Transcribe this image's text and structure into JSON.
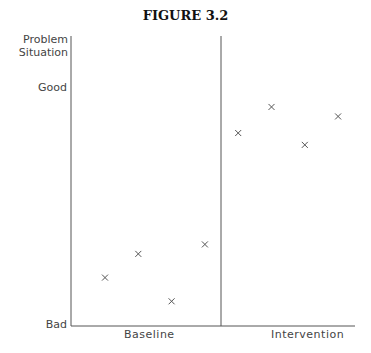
{
  "chart_data": {
    "type": "scatter",
    "title": "FIGURE 3.2",
    "ylabel": "Problem Situation",
    "xlabel": "",
    "y_ticks": [
      "Good",
      "Bad"
    ],
    "y_scale": {
      "min_label": "Bad",
      "max_label": "Good",
      "ylim": [
        0,
        10
      ],
      "note": "qualitative scale: 0 = Bad, 10 = Good"
    },
    "phases": [
      "Baseline",
      "Intervention"
    ],
    "grid": false,
    "series": [
      {
        "name": "Baseline",
        "x": [
          1,
          2,
          3,
          4
        ],
        "values": [
          2.0,
          3.0,
          1.0,
          3.4
        ]
      },
      {
        "name": "Intervention",
        "x": [
          5,
          6,
          7,
          8
        ],
        "values": [
          8.1,
          9.2,
          7.6,
          8.8
        ]
      }
    ],
    "marker": "x",
    "phase_divider_after_x": 4.5
  },
  "figure": {
    "title": "FIGURE 3.2",
    "ylabel_line1": "Problem",
    "ylabel_line2": "Situation",
    "tick_good": "Good",
    "tick_bad": "Bad",
    "phase_baseline": "Baseline",
    "phase_intervention": "Intervention"
  }
}
